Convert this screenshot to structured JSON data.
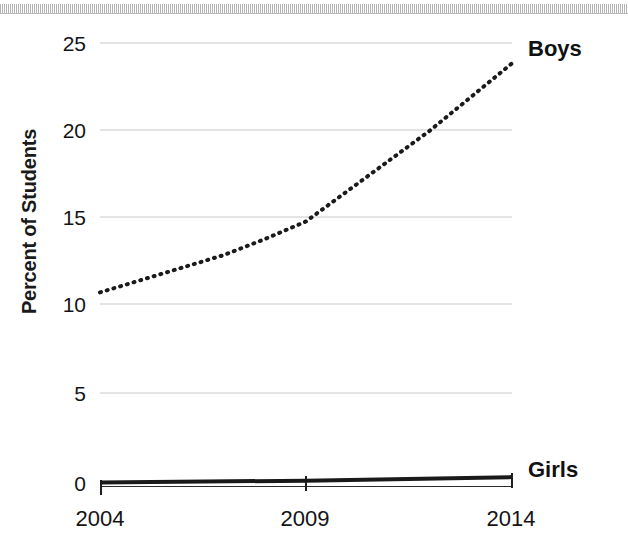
{
  "chart_data": {
    "type": "line",
    "title": "",
    "xlabel": "",
    "ylabel": "Percent of Students",
    "x": [
      2004,
      2009,
      2014
    ],
    "xtick_labels": [
      "2004",
      "2009",
      "2014"
    ],
    "ytick_labels": [
      "0",
      "5",
      "10",
      "15",
      "20",
      "25"
    ],
    "ytick_values": [
      0,
      5,
      10,
      15,
      20,
      25
    ],
    "ylim": [
      0,
      25
    ],
    "xlim": [
      2004,
      2014
    ],
    "grid": true,
    "legend_position": "inline-right",
    "series": [
      {
        "name": "Boys",
        "style": "dotted",
        "color": "#1a1a1a",
        "x": [
          2004,
          2005,
          2006,
          2007,
          2008,
          2009,
          2010,
          2011,
          2012,
          2013,
          2014
        ],
        "values": [
          10.9,
          11.6,
          12.3,
          13.0,
          13.9,
          14.9,
          16.6,
          18.3,
          20.0,
          21.9,
          23.8
        ]
      },
      {
        "name": "Girls",
        "style": "solid",
        "color": "#1a1a1a",
        "x": [
          2004,
          2009,
          2014
        ],
        "values": [
          0.2,
          0.3,
          0.5
        ]
      }
    ]
  },
  "axis": {
    "ylabel": "Percent of Students",
    "yticks": [
      {
        "label": "25",
        "value": 25
      },
      {
        "label": "20",
        "value": 20
      },
      {
        "label": "15",
        "value": 15
      },
      {
        "label": "10",
        "value": 10
      },
      {
        "label": "5",
        "value": 5
      },
      {
        "label": "0",
        "value": 0
      }
    ],
    "xticks": [
      {
        "label": "2004",
        "value": 2004
      },
      {
        "label": "2009",
        "value": 2009
      },
      {
        "label": "2014",
        "value": 2014
      }
    ]
  },
  "legend": {
    "boys_label": "Boys",
    "girls_label": "Girls"
  },
  "colors": {
    "ink": "#1a1a1a",
    "gridline": "#e4e4e4",
    "background": "#ffffff"
  }
}
